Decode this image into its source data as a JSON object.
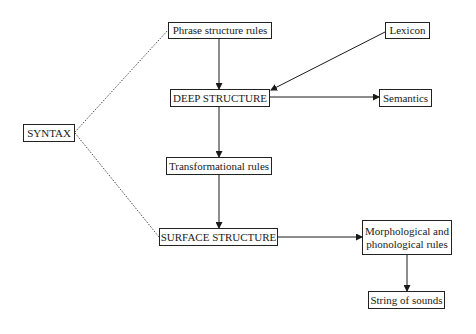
{
  "diagram": {
    "nodes": {
      "syntax": {
        "label": "SYNTAX"
      },
      "phrase_structure_rules": {
        "label": "Phrase structure rules"
      },
      "lexicon": {
        "label": "Lexicon"
      },
      "deep_structure": {
        "label": "DEEP STRUCTURE"
      },
      "semantics": {
        "label": "Semantics"
      },
      "transformational_rules": {
        "label": "Transformational rules"
      },
      "surface_structure": {
        "label": "SURFACE STRUCTURE"
      },
      "morph_phon_rules": {
        "label_line1": "Morphological and",
        "label_line2": "phonological rules"
      },
      "string_of_sounds": {
        "label": "String of sounds"
      }
    },
    "edges": [
      {
        "from": "syntax",
        "to": "phrase_structure_rules",
        "style": "dotted"
      },
      {
        "from": "syntax",
        "to": "surface_structure",
        "style": "dotted"
      },
      {
        "from": "phrase_structure_rules",
        "to": "deep_structure",
        "style": "arrow"
      },
      {
        "from": "lexicon",
        "to": "deep_structure",
        "style": "arrow"
      },
      {
        "from": "deep_structure",
        "to": "semantics",
        "style": "arrow"
      },
      {
        "from": "deep_structure",
        "to": "transformational_rules",
        "style": "arrow"
      },
      {
        "from": "transformational_rules",
        "to": "surface_structure",
        "style": "arrow"
      },
      {
        "from": "surface_structure",
        "to": "morph_phon_rules",
        "style": "arrow"
      },
      {
        "from": "morph_phon_rules",
        "to": "string_of_sounds",
        "style": "arrow"
      }
    ]
  }
}
